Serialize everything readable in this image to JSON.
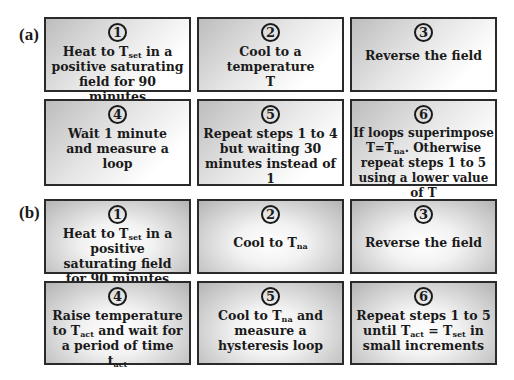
{
  "panels": [
    {
      "label": "(a)",
      "steps": [
        {
          "num": "1",
          "parts": [
            "Heat to T",
            "set",
            " in a positive saturating field for 90 minutes"
          ]
        },
        {
          "num": "2",
          "text": "Cool to a temperature T"
        },
        {
          "num": "3",
          "text": "Reverse the field"
        },
        {
          "num": "4",
          "text": "Wait 1 minute and measure a loop"
        },
        {
          "num": "5",
          "text": "Repeat steps 1 to 4 but waiting 30 minutes instead of 1"
        },
        {
          "num": "6",
          "parts": [
            "If loops superimpose T=T",
            "na",
            ". Otherwise repeat steps 1 to 5 using a lower value of T"
          ]
        }
      ]
    },
    {
      "label": "(b)",
      "steps": [
        {
          "num": "1",
          "parts": [
            "Heat to T",
            "set",
            " in a positive saturating field for 90 minutes"
          ]
        },
        {
          "num": "2",
          "parts": [
            "Cool to T",
            "na"
          ]
        },
        {
          "num": "3",
          "text": "Reverse the field"
        },
        {
          "num": "4",
          "parts": [
            "Raise temperature to T",
            "act",
            " and wait for a period of time t",
            "act"
          ]
        },
        {
          "num": "5",
          "parts": [
            "Cool to T",
            "na",
            " and measure a hysteresis loop"
          ]
        },
        {
          "num": "6",
          "parts": [
            "Repeat steps 1 to 5 until T",
            "act",
            " = T",
            "set",
            " in small increments"
          ]
        }
      ]
    }
  ],
  "colors": {
    "border": "#2a2a2a",
    "text": "#1a1a1a",
    "gradient_dark": "#b4b4b4",
    "gradient_light": "#ffffff"
  }
}
